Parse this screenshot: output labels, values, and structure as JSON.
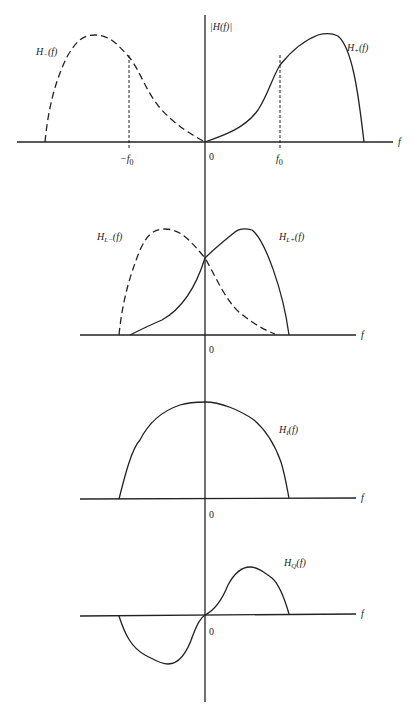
{
  "figure": {
    "y_axis_label": "|H(f)|",
    "panels": [
      {
        "id": "panel-1",
        "x_axis_label": "f",
        "origin_label": "0",
        "ticks": [
          "-f0",
          "f0"
        ],
        "ticks_display": {
          "neg": "−f",
          "neg_sub": "0",
          "pos": "f",
          "pos_sub": "0"
        },
        "curves": [
          {
            "name": "H_(f)",
            "display": "H",
            "sub": "−",
            "arg": "(f)",
            "style": "dashed"
          },
          {
            "name": "H+(f)",
            "display": "H",
            "sub": "+",
            "arg": "(f)",
            "style": "solid"
          }
        ]
      },
      {
        "id": "panel-2",
        "x_axis_label": "f",
        "origin_label": "0",
        "curves": [
          {
            "name": "HL_(f)",
            "display": "H",
            "sub": "L−",
            "arg": "(f)",
            "style": "dashed"
          },
          {
            "name": "HL+(f)",
            "display": "H",
            "sub": "L+",
            "arg": "(f)",
            "style": "solid"
          }
        ]
      },
      {
        "id": "panel-3",
        "x_axis_label": "f",
        "origin_label": "0",
        "curves": [
          {
            "name": "HI(f)",
            "display": "H",
            "sub": "I",
            "arg": "(f)",
            "style": "solid"
          }
        ]
      },
      {
        "id": "panel-4",
        "x_axis_label": "f",
        "origin_label": "0",
        "curves": [
          {
            "name": "HQ(f)",
            "display": "H",
            "sub": "Q",
            "arg": "(f)",
            "style": "solid"
          }
        ]
      }
    ]
  }
}
